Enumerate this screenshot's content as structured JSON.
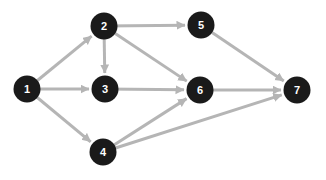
{
  "diagram": {
    "type": "directed-graph",
    "canvas": {
      "width": 326,
      "height": 180,
      "background": "#ffffff"
    },
    "colors": {
      "node_fill": "#1a1a1a",
      "node_label": "#ffffff",
      "edge": "#b5b5b5"
    },
    "node_radius": 13.5,
    "edge_stroke_width": 3,
    "nodes": [
      {
        "id": "1",
        "label": "1",
        "x": 27,
        "y": 89
      },
      {
        "id": "2",
        "label": "2",
        "x": 104,
        "y": 26
      },
      {
        "id": "3",
        "label": "3",
        "x": 105,
        "y": 89
      },
      {
        "id": "4",
        "label": "4",
        "x": 103,
        "y": 152
      },
      {
        "id": "5",
        "label": "5",
        "x": 201,
        "y": 25
      },
      {
        "id": "6",
        "label": "6",
        "x": 200,
        "y": 90
      },
      {
        "id": "7",
        "label": "7",
        "x": 297,
        "y": 90
      }
    ],
    "edges": [
      {
        "from": "1",
        "to": "2"
      },
      {
        "from": "1",
        "to": "3"
      },
      {
        "from": "1",
        "to": "4"
      },
      {
        "from": "2",
        "to": "3"
      },
      {
        "from": "2",
        "to": "5"
      },
      {
        "from": "2",
        "to": "6"
      },
      {
        "from": "3",
        "to": "6"
      },
      {
        "from": "4",
        "to": "6"
      },
      {
        "from": "4",
        "to": "7"
      },
      {
        "from": "5",
        "to": "7"
      },
      {
        "from": "6",
        "to": "7"
      }
    ]
  }
}
